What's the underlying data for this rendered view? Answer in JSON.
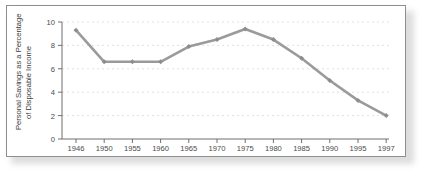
{
  "figure": {
    "frame_border_color": "#8e8e8e",
    "background_color": "#ffffff"
  },
  "chart_data": {
    "type": "line",
    "title": "",
    "subtitle": "",
    "xlabel": "Year",
    "ylabel": "Personal Savings as a Percentage of Disposable Income",
    "ylabel_line1": "Personal Savings as a Percentage",
    "ylabel_line2": "of Disposable Income",
    "categories": [
      "1946",
      "1950",
      "1955",
      "1960",
      "1965",
      "1970",
      "1975",
      "1980",
      "1985",
      "1990",
      "1995",
      "1997"
    ],
    "x": [
      1946,
      1950,
      1955,
      1960,
      1965,
      1970,
      1975,
      1980,
      1985,
      1990,
      1995,
      1997
    ],
    "values": [
      9.3,
      6.6,
      6.6,
      6.6,
      7.9,
      8.5,
      9.4,
      8.5,
      6.9,
      5.0,
      3.3,
      2.0
    ],
    "series": [
      {
        "name": "Personal Savings Rate",
        "values": [
          9.3,
          6.6,
          6.6,
          6.6,
          7.9,
          8.5,
          9.4,
          8.5,
          6.9,
          5.0,
          3.3,
          2.0
        ],
        "color": "#9a9a9a",
        "marker": "diamond"
      }
    ],
    "ytick_labels": [
      "0",
      "2",
      "4",
      "6",
      "8",
      "10"
    ],
    "yticks": [
      0,
      2,
      4,
      6,
      8,
      10
    ],
    "ylim": [
      0,
      10
    ],
    "xlim_category_index": [
      0,
      11
    ],
    "grid": true,
    "grid_axis": "y",
    "grid_style": "dotted",
    "grid_color": "#e9dede",
    "legend": "none",
    "axis_color": "#6f6f6f",
    "line_color": "#9a9a9a",
    "marker_color": "#8d8d8d",
    "annotations": []
  }
}
